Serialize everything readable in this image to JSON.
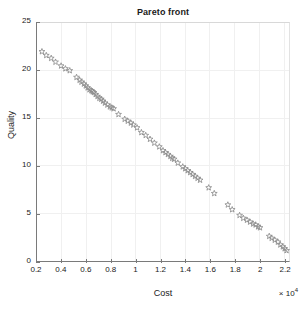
{
  "chart_data": {
    "type": "scatter",
    "title": "Pareto front",
    "xlabel": "Cost",
    "ylabel": "Quality",
    "x_exponent_label": "× 10",
    "x_exponent_power": "4",
    "x_scale_factor": 10000,
    "xlim": [
      2000,
      22400
    ],
    "ylim": [
      0,
      25
    ],
    "xticks": [
      0.2,
      0.4,
      0.6,
      0.8,
      1,
      1.2,
      1.4,
      1.6,
      1.8,
      2,
      2.2
    ],
    "xtick_labels": [
      "0.2",
      "0.4",
      "0.6",
      "0.8",
      "1",
      "1.2",
      "1.4",
      "1.6",
      "1.8",
      "2",
      "2.2"
    ],
    "yticks": [
      0,
      5,
      10,
      15,
      20,
      25
    ],
    "ytick_labels": [
      "0",
      "5",
      "10",
      "15",
      "20",
      "25"
    ],
    "grid": true,
    "legend": "none",
    "marker": "pentagram-open",
    "marker_color": "#8b8b8b",
    "series": [
      {
        "name": "Pareto front",
        "points": [
          [
            2400,
            22.0
          ],
          [
            2750,
            21.6
          ],
          [
            3150,
            21.3
          ],
          [
            3500,
            20.9
          ],
          [
            3950,
            20.5
          ],
          [
            4300,
            20.2
          ],
          [
            4650,
            20.0
          ],
          [
            5200,
            19.3
          ],
          [
            5450,
            19.0
          ],
          [
            5600,
            18.8
          ],
          [
            5800,
            18.6
          ],
          [
            5950,
            18.4
          ],
          [
            6100,
            18.2
          ],
          [
            6250,
            18.0
          ],
          [
            6400,
            17.9
          ],
          [
            6500,
            17.8
          ],
          [
            6600,
            17.7
          ],
          [
            6750,
            17.5
          ],
          [
            6900,
            17.3
          ],
          [
            7050,
            17.1
          ],
          [
            7200,
            17.0
          ],
          [
            7350,
            16.8
          ],
          [
            7500,
            16.6
          ],
          [
            7700,
            16.4
          ],
          [
            7900,
            16.2
          ],
          [
            8050,
            16.1
          ],
          [
            8200,
            16.0
          ],
          [
            8600,
            15.4
          ],
          [
            9100,
            14.9
          ],
          [
            9350,
            14.7
          ],
          [
            9600,
            14.5
          ],
          [
            9800,
            14.3
          ],
          [
            10100,
            14.0
          ],
          [
            10450,
            13.5
          ],
          [
            10800,
            13.2
          ],
          [
            11150,
            12.8
          ],
          [
            11500,
            12.4
          ],
          [
            11900,
            12.0
          ],
          [
            12200,
            11.6
          ],
          [
            12400,
            11.4
          ],
          [
            12600,
            11.2
          ],
          [
            12800,
            11.0
          ],
          [
            12950,
            10.8
          ],
          [
            13100,
            10.7
          ],
          [
            13400,
            10.3
          ],
          [
            13800,
            9.9
          ],
          [
            14000,
            9.7
          ],
          [
            14200,
            9.5
          ],
          [
            14400,
            9.3
          ],
          [
            14600,
            9.1
          ],
          [
            14800,
            8.9
          ],
          [
            15000,
            8.7
          ],
          [
            15200,
            8.5
          ],
          [
            15900,
            7.7
          ],
          [
            16350,
            7.1
          ],
          [
            17450,
            5.9
          ],
          [
            17800,
            5.4
          ],
          [
            18400,
            4.8
          ],
          [
            18700,
            4.5
          ],
          [
            19000,
            4.3
          ],
          [
            19250,
            4.1
          ],
          [
            19500,
            3.9
          ],
          [
            19700,
            3.8
          ],
          [
            19900,
            3.6
          ],
          [
            20050,
            3.5
          ],
          [
            20800,
            2.6
          ],
          [
            21000,
            2.4
          ],
          [
            21250,
            2.2
          ],
          [
            21500,
            2.0
          ],
          [
            21700,
            1.7
          ],
          [
            21900,
            1.5
          ],
          [
            22050,
            1.3
          ],
          [
            22200,
            1.1
          ]
        ]
      }
    ]
  }
}
